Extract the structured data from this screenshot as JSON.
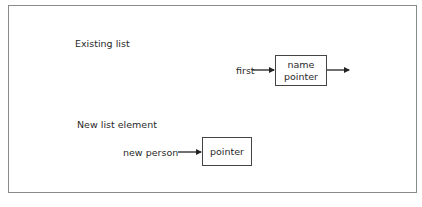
{
  "diagram": {
    "sections": [
      {
        "title": "Existing list"
      },
      {
        "title": "New list element"
      }
    ],
    "existing": {
      "pointer_label": "first",
      "node_fields": [
        "name",
        "pointer"
      ]
    },
    "new_element": {
      "pointer_label": "new person",
      "node_fields": [
        "pointer"
      ]
    }
  }
}
